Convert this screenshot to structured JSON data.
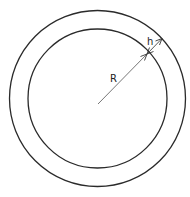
{
  "diagram": {
    "labels": {
      "radius": "R",
      "thickness": "h"
    },
    "colors": {
      "background": "#ffffff",
      "stroke": "#2a2a2a",
      "radius_line": "#555555"
    },
    "shapes": {
      "outer_circle": {
        "cx": 97.5,
        "cy": 98.5,
        "r": 88
      },
      "inner_circle": {
        "cx": 97.5,
        "cy": 98.5,
        "r": 69.5
      }
    }
  }
}
